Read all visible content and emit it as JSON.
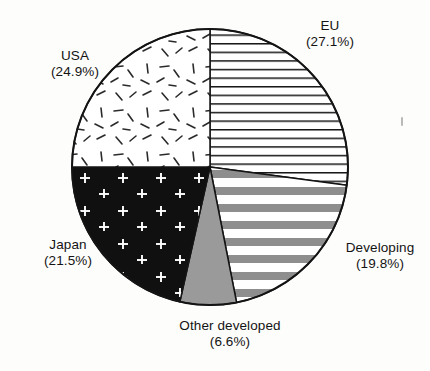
{
  "figure": {
    "background_color": "#fdfdfb",
    "ink_color": "#141414"
  },
  "chart_data": {
    "type": "pie",
    "title": "",
    "subtitle": "",
    "xlabel": "",
    "ylabel": "",
    "legend_position": "none",
    "labels_position": "outside",
    "start_angle_deg": 0,
    "direction": "clockwise",
    "center": {
      "x": 210,
      "y": 167
    },
    "radius": 138,
    "categories": [
      "EU",
      "Developing",
      "Other developed",
      "Japan",
      "USA"
    ],
    "values": [
      27.1,
      19.8,
      6.6,
      21.5,
      24.9
    ],
    "value_unit": "%",
    "slices": [
      {
        "label": "EU",
        "value": 27.1,
        "value_text": "(27.1%)",
        "pattern": "thin-horizontal-lines",
        "fill": "#ffffff",
        "stroke": "#141414",
        "start_deg": 0.0,
        "end_deg": 97.6
      },
      {
        "label": "Developing",
        "value": 19.8,
        "value_text": "(19.8%)",
        "pattern": "thick-gray-horizontal-bands",
        "fill": "#ffffff",
        "stroke": "#141414",
        "start_deg": 97.6,
        "end_deg": 168.9
      },
      {
        "label": "Other developed",
        "value": 6.6,
        "value_text": "(6.6%)",
        "pattern": "solid-gray",
        "fill": "#9a9a9a",
        "stroke": "#141414",
        "start_deg": 168.9,
        "end_deg": 192.6
      },
      {
        "label": "Japan",
        "value": 21.5,
        "value_text": "(21.5%)",
        "pattern": "black-with-white-plus-marks",
        "fill": "#101010",
        "stroke": "#141414",
        "start_deg": 192.6,
        "end_deg": 270.0
      },
      {
        "label": "USA",
        "value": 24.9,
        "value_text": "(24.9%)",
        "pattern": "scattered-short-dashes",
        "fill": "#ffffff",
        "stroke": "#141414",
        "start_deg": 270.0,
        "end_deg": 360.0
      }
    ]
  },
  "labels": {
    "eu": {
      "name": "EU",
      "pct": "(27.1%)"
    },
    "usa": {
      "name": "USA",
      "pct": "(24.9%)"
    },
    "japan": {
      "name": "Japan",
      "pct": "(21.5%)"
    },
    "developing": {
      "name": "Developing",
      "pct": "(19.8%)"
    },
    "other": {
      "name": "Other developed",
      "pct": "(6.6%)"
    }
  }
}
